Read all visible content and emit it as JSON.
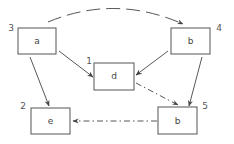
{
  "diagram": {
    "nodes": [
      {
        "id": "n3",
        "label": "a",
        "number": "3"
      },
      {
        "id": "n4",
        "label": "b",
        "number": "4"
      },
      {
        "id": "n1",
        "label": "d",
        "number": "1"
      },
      {
        "id": "n2",
        "label": "e",
        "number": "2"
      },
      {
        "id": "n5",
        "label": "b",
        "number": "5"
      }
    ],
    "edges": [
      {
        "from": "n3",
        "to": "n4",
        "style": "dashed-arc"
      },
      {
        "from": "n3",
        "to": "n1",
        "style": "solid"
      },
      {
        "from": "n3",
        "to": "n2",
        "style": "solid"
      },
      {
        "from": "n4",
        "to": "n1",
        "style": "solid"
      },
      {
        "from": "n4",
        "to": "n5",
        "style": "solid"
      },
      {
        "from": "n1",
        "to": "n5",
        "style": "dash-dot"
      },
      {
        "from": "n5",
        "to": "n2",
        "style": "dash-dot"
      }
    ]
  }
}
